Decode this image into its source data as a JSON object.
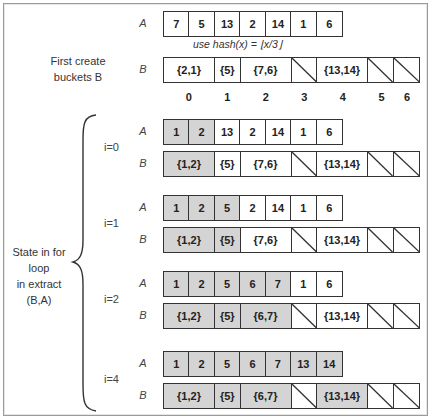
{
  "title_left": "First create\nbuckets B",
  "hash_note": "use hash(x) = ⌊x/3⌋",
  "state_label": "State in for loop\nin extract (B,A)",
  "row_labels": {
    "a": "A",
    "b": "B"
  },
  "bucket_indices": [
    "0",
    "1",
    "2",
    "3",
    "4",
    "5",
    "6"
  ],
  "initial": {
    "A": [
      "7",
      "5",
      "13",
      "2",
      "14",
      "1",
      "6"
    ],
    "B": [
      "{2,1}",
      "{5}",
      "{7,6}",
      "",
      "{13,14}",
      "",
      ""
    ]
  },
  "iterations": [
    {
      "label": "i=0",
      "A": [
        "1",
        "2",
        "13",
        "2",
        "14",
        "1",
        "6"
      ],
      "A_shaded": 2,
      "B": [
        "{1,2}",
        "{5}",
        "{7,6}",
        "",
        "{13,14}",
        "",
        ""
      ],
      "B_shaded": [
        0
      ]
    },
    {
      "label": "i=1",
      "A": [
        "1",
        "2",
        "5",
        "2",
        "14",
        "1",
        "6"
      ],
      "A_shaded": 3,
      "B": [
        "{1,2}",
        "{5}",
        "{7,6}",
        "",
        "{13,14}",
        "",
        ""
      ],
      "B_shaded": [
        0,
        1
      ]
    },
    {
      "label": "i=2",
      "A": [
        "1",
        "2",
        "5",
        "6",
        "7",
        "1",
        "6"
      ],
      "A_shaded": 5,
      "B": [
        "{1,2}",
        "{5}",
        "{6,7}",
        "",
        "{13,14}",
        "",
        ""
      ],
      "B_shaded": [
        0,
        1,
        2
      ]
    },
    {
      "label": "i=4",
      "A": [
        "1",
        "2",
        "5",
        "6",
        "7",
        "13",
        "14"
      ],
      "A_shaded": 7,
      "B": [
        "{1,2}",
        "{5}",
        "{6,7}",
        "",
        "{13,14}",
        "",
        ""
      ],
      "B_shaded": [
        0,
        1,
        2,
        4
      ]
    }
  ],
  "colors": {
    "shaded": "#d4d4d4",
    "border": "#333333"
  }
}
